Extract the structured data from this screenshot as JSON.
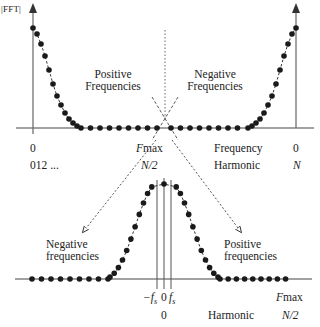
{
  "chart_data": {
    "type": "scatter",
    "title": "",
    "top_panel": {
      "ylabel": "|FFT|",
      "x_start_labels": {
        "frequency": "0",
        "harmonic": "012 ..."
      },
      "x_mid_labels": {
        "frequency_prefix": "F",
        "frequency_suffix": "max",
        "harmonic": "N/2"
      },
      "x_row_names": {
        "frequency": "Frequency",
        "harmonic": "Harmonic"
      },
      "x_end_labels": {
        "frequency": "0",
        "harmonic": "N"
      },
      "annotations": [
        "Positive Frequencies",
        "Negative Frequencies"
      ],
      "left_decay_values": [
        1.0,
        0.94,
        0.84,
        0.72,
        0.58,
        0.44,
        0.32,
        0.23,
        0.15,
        0.09,
        0.05,
        0.02,
        0.0
      ],
      "flat_count_left": 8,
      "flat_count_right": 8,
      "right_rise_values": [
        0.0,
        0.02,
        0.05,
        0.09,
        0.15,
        0.23,
        0.32,
        0.44,
        0.58,
        0.72,
        0.84,
        0.94,
        1.0
      ]
    },
    "bottom_panel": {
      "annotations": [
        "Negative frequencies",
        "Positive frequencies"
      ],
      "x_tick_labels": {
        "neg_fs": "−f",
        "zero": "0",
        "pos_fs": "f",
        "subscript": "s"
      },
      "x_second_row": {
        "zero": "0",
        "harmonic": "Harmonic",
        "end": "N/2"
      },
      "x_end_label_prefix": "F",
      "x_end_label_suffix": "max",
      "flat_count_left": 9,
      "flat_count_right": 9,
      "peak_values": [
        0.02,
        0.06,
        0.12,
        0.2,
        0.3,
        0.42,
        0.55,
        0.68,
        0.8,
        0.9,
        0.97,
        1.0
      ]
    }
  }
}
